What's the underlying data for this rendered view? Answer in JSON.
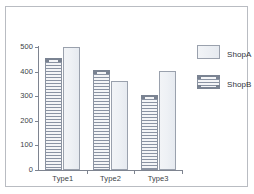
{
  "chart_data": {
    "type": "bar",
    "title": "",
    "xlabel": "",
    "ylabel": "",
    "categories": [
      "Type1",
      "Type2",
      "Type3"
    ],
    "series": [
      {
        "name": "ShopA",
        "values": [
          500,
          362,
          402
        ],
        "style": "solid-light"
      },
      {
        "name": "ShopB",
        "values": [
          455,
          406,
          305
        ],
        "style": "horizontal-hatch"
      }
    ],
    "series_draw_order": [
      "ShopB",
      "ShopA"
    ],
    "ylim": [
      0,
      500
    ],
    "yticks": [
      0,
      100,
      200,
      300,
      400,
      500
    ],
    "ytick_labels": [
      "0",
      "100",
      "200",
      "300",
      "400",
      "500"
    ],
    "grid": false,
    "legend_position": "right",
    "colors": {
      "bar_shopA_fill": "#eef1f5",
      "bar_shopA_edge": "#9aa1ad",
      "bar_shopB_hatch": "#8a93a3",
      "bar_shopB_edge": "#8b93a1",
      "axis": "#7e8490",
      "text": "#3c3f46",
      "frame_border": "#b9bcc2",
      "background": "#ffffff"
    }
  },
  "legend": {
    "entries": [
      {
        "label": "ShopA",
        "swatch": "plain-swatch-icon"
      },
      {
        "label": "ShopB",
        "swatch": "hatched-swatch-icon"
      }
    ]
  }
}
